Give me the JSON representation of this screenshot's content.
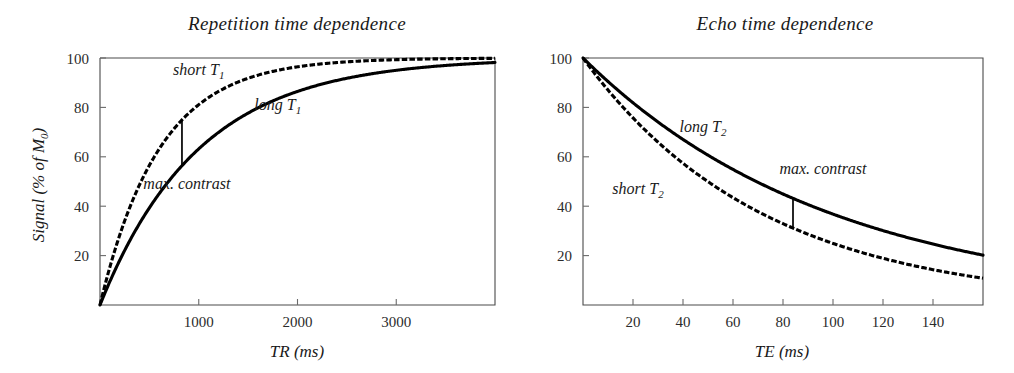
{
  "figure": {
    "background": "#ffffff",
    "curve_color": "#000000",
    "axis_color": "#4a4a4a"
  },
  "chart_data": [
    {
      "type": "line",
      "id": "repetition-time-dependence",
      "title": "Repetition time dependence",
      "xlabel": "TR (ms)",
      "ylabel": "Signal (% of M0)",
      "ylabel_display": "Signal (% of M₀)",
      "xlim": [
        0,
        4000
      ],
      "ylim": [
        0,
        100
      ],
      "xticks": [
        1000,
        2000,
        3000
      ],
      "yticks": [
        20,
        40,
        60,
        80,
        100
      ],
      "grid": false,
      "legend": "inline-annotations",
      "series": [
        {
          "name": "short T1",
          "label_display": "short T₁",
          "style": "dashed",
          "model": "100*(1-exp(-TR/T1))",
          "T1_ms": 600,
          "label_x": 1000,
          "label_y": 93,
          "x": [
            0,
            100,
            200,
            300,
            400,
            500,
            600,
            800,
            1000,
            1200,
            1500,
            2000,
            2500,
            3000,
            3500,
            4000
          ],
          "y": [
            0,
            15.4,
            28.3,
            39.3,
            48.7,
            56.5,
            63.2,
            73.6,
            81.1,
            86.5,
            91.8,
            96.5,
            98.5,
            99.3,
            99.7,
            99.9
          ]
        },
        {
          "name": "long T1",
          "label_display": "long T₁",
          "style": "solid",
          "model": "100*(1-exp(-TR/T1))",
          "T1_ms": 1000,
          "label_x": 1800,
          "label_y": 79,
          "x": [
            0,
            100,
            200,
            300,
            400,
            500,
            600,
            800,
            1000,
            1200,
            1500,
            2000,
            2500,
            3000,
            3500,
            4000
          ],
          "y": [
            0,
            9.5,
            18.1,
            25.9,
            33.0,
            39.3,
            45.1,
            55.1,
            63.2,
            69.9,
            77.7,
            86.5,
            91.8,
            95.0,
            97.0,
            98.2
          ]
        }
      ],
      "annotations": [
        {
          "name": "max-contrast",
          "text": "max. contrast",
          "marker": "vertical-bar",
          "x": 830,
          "y_top": 74.5,
          "y_bottom": 56.5,
          "label_x": 880,
          "label_y": 47
        }
      ]
    },
    {
      "type": "line",
      "id": "echo-time-dependence",
      "title": "Echo time dependence",
      "xlabel": "TE (ms)",
      "ylabel": "",
      "xlim": [
        0,
        160
      ],
      "ylim": [
        0,
        100
      ],
      "xticks": [
        20,
        40,
        60,
        80,
        100,
        120,
        140
      ],
      "yticks": [
        20,
        40,
        60,
        80,
        100
      ],
      "grid": false,
      "legend": "inline-annotations",
      "series": [
        {
          "name": "long T2",
          "label_display": "long T₂",
          "style": "solid",
          "model": "100*exp(-TE/T2)",
          "T2_ms": 100,
          "label_x": 48,
          "label_y": 70,
          "x": [
            0,
            10,
            20,
            30,
            40,
            50,
            60,
            70,
            80,
            90,
            100,
            120,
            140,
            160
          ],
          "y": [
            100,
            90.5,
            81.9,
            74.1,
            67.0,
            60.7,
            54.9,
            49.7,
            44.9,
            40.7,
            36.8,
            30.1,
            24.7,
            20.2
          ]
        },
        {
          "name": "short T2",
          "label_display": "short T₂",
          "style": "dashed",
          "model": "100*exp(-TE/T2)",
          "T2_ms": 72,
          "label_x": 22,
          "label_y": 45,
          "x": [
            0,
            10,
            20,
            30,
            40,
            50,
            60,
            70,
            80,
            90,
            100,
            120,
            140,
            160
          ],
          "y": [
            100,
            87.1,
            75.8,
            66.0,
            57.5,
            50.1,
            43.5,
            37.9,
            33.0,
            28.7,
            25.0,
            18.9,
            14.3,
            10.8
          ]
        }
      ],
      "annotations": [
        {
          "name": "max-contrast",
          "text": "max. contrast",
          "marker": "vertical-bar",
          "x": 84,
          "y_top": 43.5,
          "y_bottom": 31.5,
          "label_x": 96,
          "label_y": 53
        }
      ]
    }
  ]
}
